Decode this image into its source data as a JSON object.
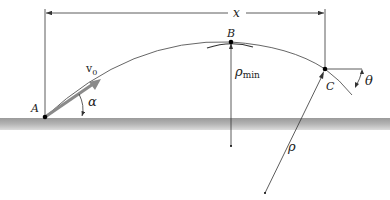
{
  "diagram": {
    "type": "projectile-trajectory",
    "points": {
      "A": {
        "label": "A"
      },
      "B": {
        "label": "B"
      },
      "C": {
        "label": "C"
      }
    },
    "labels": {
      "horizontal_distance": "x",
      "initial_velocity": "v",
      "initial_velocity_sub": "0",
      "launch_angle": "α",
      "impact_angle": "θ",
      "radius_min": "ρ",
      "radius_min_sub": "min",
      "radius": "ρ"
    },
    "colors": {
      "ground_top": "#a8a8a8",
      "ground_bottom": "#d6d6d6",
      "velocity_arrow": "#8a8a8a",
      "line": "#333333",
      "trajectory": "#555555"
    }
  }
}
